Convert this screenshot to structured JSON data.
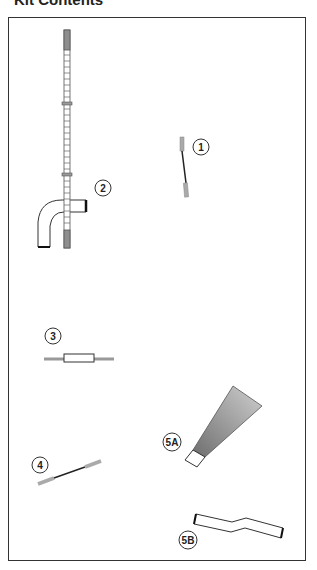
{
  "header": {
    "title": "Kit Contents"
  },
  "components": [
    {
      "id": "1",
      "label": "1",
      "description": "short cable with grey ferrules"
    },
    {
      "id": "2",
      "label": "2",
      "description": "long graduated tube with elbow connector"
    },
    {
      "id": "3",
      "label": "3",
      "description": "inline connector sleeve"
    },
    {
      "id": "4",
      "label": "4",
      "description": "short cable with grey ferrules"
    },
    {
      "id": "5A",
      "label": "5A",
      "description": "conical funnel / nozzle"
    },
    {
      "id": "5B",
      "label": "5B",
      "description": "bent hose"
    }
  ],
  "colors": {
    "outline": "#333333",
    "ferrule": "#9a9a9a",
    "cable": "#222222",
    "funnel_gradient_start": "#d0d0d0",
    "funnel_gradient_end": "#707070"
  }
}
